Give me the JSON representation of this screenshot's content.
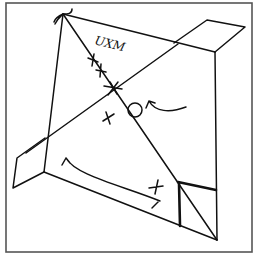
{
  "diagram": {
    "type": "hand-drawn sketch",
    "annotation_text": "UXM",
    "marks": {
      "crosses_on_diagonal": 3,
      "center_star": 1,
      "loose_crosses": 2,
      "circle": 1,
      "curved_arrows": 2
    },
    "colors": {
      "ink": "#111111",
      "frame": "#555555",
      "background": "#ffffff"
    }
  }
}
